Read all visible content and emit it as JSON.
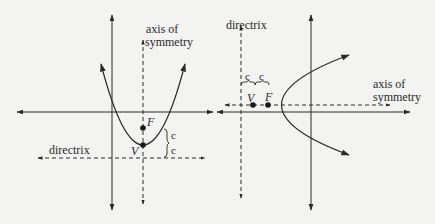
{
  "figure": {
    "background": "#f3f3f1",
    "stroke_color": "#2a2a2a",
    "left_diagram": {
      "description": "upward-opening parabola with vertical axis of symmetry",
      "axis_of_symmetry_label_line1": "axis of",
      "axis_of_symmetry_label_line2": "symmetry",
      "directrix_label": "directrix",
      "vertex_label": "V",
      "focus_label": "F",
      "distance_label_upper": "c",
      "distance_label_lower": "c"
    },
    "right_diagram": {
      "description": "right-opening parabola with horizontal axis of symmetry",
      "directrix_label": "directrix",
      "axis_of_symmetry_label_line1": "axis of",
      "axis_of_symmetry_label_line2": "symmetry",
      "vertex_label": "V",
      "focus_label": "F",
      "distance_label_left": "c",
      "distance_label_right": "c"
    }
  }
}
